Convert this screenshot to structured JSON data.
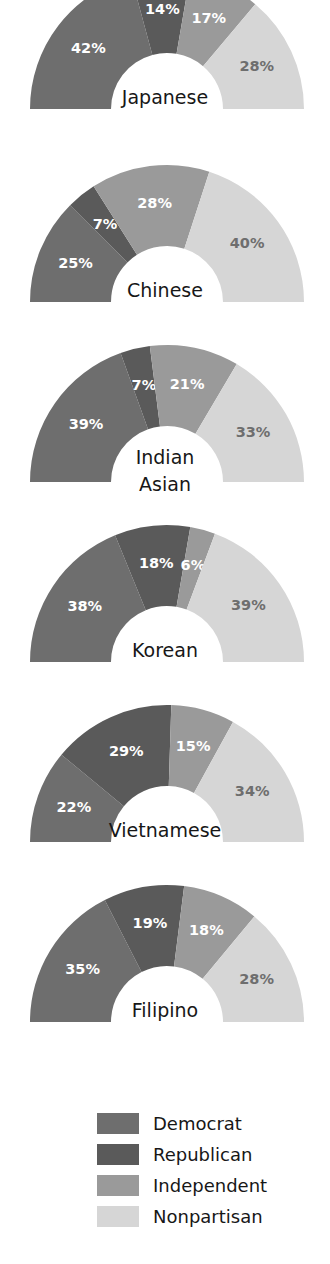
{
  "chart_data": {
    "type": "pie",
    "title": "",
    "subtype": "half-donut gauge, small multiples",
    "legend_position": "bottom-center",
    "categories": [
      "Democrat",
      "Republican",
      "Independent",
      "Nonpartisan"
    ],
    "colors": {
      "Democrat": "#6e6e6e",
      "Republican": "#5a5a5a",
      "Independent": "#9a9a9a",
      "Nonpartisan": "#d6d6d6",
      "background": "#ffffff",
      "label_on_dark": "#ffffff",
      "label_on_light": "#6e6e6e",
      "group_name": "#171717"
    },
    "units": "percent",
    "charts": [
      {
        "group": "Japanese",
        "group_lines": [
          "Japanese"
        ],
        "clipped_top": true,
        "values": [
          42,
          14,
          17,
          28
        ],
        "labels": [
          "42%",
          "14%",
          "17%",
          "28%"
        ]
      },
      {
        "group": "Chinese",
        "group_lines": [
          "Chinese"
        ],
        "clipped_top": false,
        "values": [
          25,
          7,
          28,
          40
        ],
        "labels": [
          "25%",
          "7%",
          "28%",
          "40%"
        ]
      },
      {
        "group": "Indian Asian",
        "group_lines": [
          "Indian",
          "Asian"
        ],
        "clipped_top": false,
        "values": [
          39,
          7,
          21,
          33
        ],
        "labels": [
          "39%",
          "7%",
          "21%",
          "33%"
        ]
      },
      {
        "group": "Korean",
        "group_lines": [
          "Korean"
        ],
        "clipped_top": false,
        "values": [
          38,
          18,
          6,
          39
        ],
        "labels": [
          "38%",
          "18%",
          "6%",
          "39%"
        ]
      },
      {
        "group": "Vietnamese",
        "group_lines": [
          "Vietnamese"
        ],
        "clipped_top": false,
        "values": [
          22,
          29,
          15,
          34
        ],
        "labels": [
          "22%",
          "29%",
          "15%",
          "34%"
        ]
      },
      {
        "group": "Filipino",
        "group_lines": [
          "Filipino"
        ],
        "clipped_top": false,
        "values": [
          35,
          19,
          18,
          28
        ],
        "labels": [
          "35%",
          "19%",
          "18%",
          "28%"
        ]
      }
    ]
  },
  "legend": {
    "items": [
      {
        "label": "Democrat",
        "color": "#6e6e6e"
      },
      {
        "label": "Republican",
        "color": "#5a5a5a"
      },
      {
        "label": "Independent",
        "color": "#9a9a9a"
      },
      {
        "label": "Nonpartisan",
        "color": "#d6d6d6"
      }
    ]
  }
}
